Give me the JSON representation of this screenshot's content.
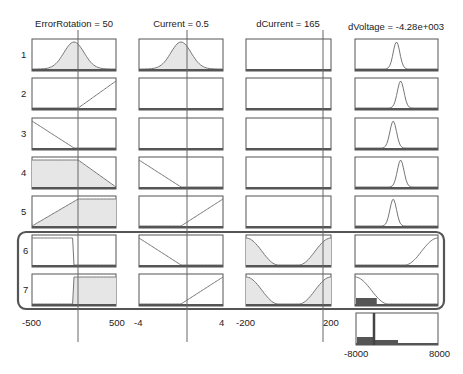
{
  "colors": {
    "box_border": "#555555",
    "fill": "#e6e6e6",
    "curve": "#777777",
    "index_line": "#666666",
    "highlight_border": "#555555",
    "bar": "#555555"
  },
  "layout": {
    "row_tops": [
      39,
      78,
      118,
      157,
      196,
      235,
      274
    ],
    "box_height": 32,
    "columns": [
      {
        "x": 32,
        "w": 84
      },
      {
        "x": 139,
        "w": 84
      },
      {
        "x": 246,
        "w": 85
      },
      {
        "x": 355,
        "w": 83
      }
    ],
    "highlight": {
      "x": 18,
      "y": 232,
      "w": 426,
      "h": 77,
      "r": 8
    },
    "output_box": {
      "x": 356,
      "y": 313,
      "w": 82,
      "h": 32
    }
  },
  "inputs": [
    {
      "name": "ErrorRotation",
      "title": "ErrorRotation = 50",
      "value": 50,
      "range": [
        -500,
        500
      ],
      "min_label": "-500",
      "max_label": "500",
      "index_x": 78
    },
    {
      "name": "Current",
      "title": "Current = 0.5",
      "value": 0.5,
      "range": [
        -4,
        4
      ],
      "min_label": "-4",
      "max_label": "4",
      "index_x": 187
    },
    {
      "name": "dCurrent",
      "title": "dCurrent = 165",
      "value": 165,
      "range": [
        -200,
        200
      ],
      "min_label": "-200",
      "max_label": "200",
      "index_x": 323
    }
  ],
  "output": {
    "name": "dVoltage",
    "title": "dVoltage = -4.28e+003",
    "value": -4280,
    "range": [
      -8000,
      8000
    ],
    "min_label": "-8000",
    "max_label": "8000",
    "index_x": 374
  },
  "rules": [
    {
      "number": "1",
      "mfs": [
        {
          "type": "gauss",
          "c": 0.5,
          "s": 0.12,
          "fill": true
        },
        {
          "type": "gauss",
          "c": 0.5,
          "s": 0.12,
          "fill": true
        },
        {
          "type": "none"
        },
        {
          "type": "gauss",
          "c": 0.5,
          "s": 0.04,
          "fill": false
        }
      ]
    },
    {
      "number": "2",
      "mfs": [
        {
          "type": "rise",
          "a": 0.55,
          "b": 1.0,
          "fill": false
        },
        {
          "type": "none"
        },
        {
          "type": "none"
        },
        {
          "type": "gauss",
          "c": 0.55,
          "s": 0.04,
          "fill": false
        }
      ]
    },
    {
      "number": "3",
      "mfs": [
        {
          "type": "fall",
          "a": 0.0,
          "b": 0.5,
          "fill": false
        },
        {
          "type": "none"
        },
        {
          "type": "none"
        },
        {
          "type": "gauss",
          "c": 0.46,
          "s": 0.04,
          "fill": false
        }
      ]
    },
    {
      "number": "4",
      "mfs": [
        {
          "type": "trapfall",
          "a": 0.55,
          "b": 1.0,
          "fill": true
        },
        {
          "type": "fall",
          "a": 0.0,
          "b": 0.5,
          "fill": false
        },
        {
          "type": "none"
        },
        {
          "type": "gauss",
          "c": 0.55,
          "s": 0.04,
          "fill": false
        }
      ]
    },
    {
      "number": "5",
      "mfs": [
        {
          "type": "traprise",
          "a": 0.0,
          "b": 0.55,
          "fill": true
        },
        {
          "type": "rise",
          "a": 0.5,
          "b": 1.0,
          "fill": false
        },
        {
          "type": "none"
        },
        {
          "type": "gauss",
          "c": 0.46,
          "s": 0.04,
          "fill": false
        }
      ]
    },
    {
      "number": "6",
      "mfs": [
        {
          "type": "step_down",
          "a": 0.5,
          "fill": false
        },
        {
          "type": "fall",
          "a": 0.0,
          "b": 0.5,
          "fill": false
        },
        {
          "type": "bowl",
          "fill": true
        },
        {
          "type": "rise_s",
          "a": 0.6,
          "b": 1.0,
          "fill": false
        }
      ]
    },
    {
      "number": "7",
      "mfs": [
        {
          "type": "step_up",
          "a": 0.5,
          "fill": true
        },
        {
          "type": "rise",
          "a": 0.5,
          "b": 1.0,
          "fill": false
        },
        {
          "type": "bowl",
          "fill": true
        },
        {
          "type": "fall_s",
          "a": 0.0,
          "b": 0.4,
          "fill": true
        }
      ]
    }
  ],
  "aggregate": {
    "index_frac": 0.22
  }
}
